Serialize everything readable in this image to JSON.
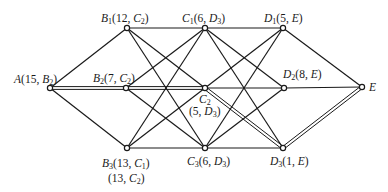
{
  "diagram": {
    "type": "multistage-shortest-path-graph",
    "colors": {
      "line": "#1a1a1a",
      "background": "#ffffff"
    },
    "nodes": [
      {
        "id": "A",
        "x": 50,
        "y": 88,
        "name": "A",
        "sub": "",
        "value": "15",
        "next": "B",
        "next_sub": "2",
        "label": "A(15, B2)"
      },
      {
        "id": "B1",
        "x": 127,
        "y": 28,
        "name": "B",
        "sub": "1",
        "value": "12",
        "next": "C",
        "next_sub": "2",
        "label": "B1(12, C2)"
      },
      {
        "id": "B2",
        "x": 126,
        "y": 88,
        "name": "B",
        "sub": "2",
        "value": "7",
        "next": "C",
        "next_sub": "2",
        "label": "B2(7, C2)"
      },
      {
        "id": "B3",
        "x": 127,
        "y": 148,
        "name": "B",
        "sub": "3",
        "value": "13",
        "next": "C",
        "next_sub": "1",
        "label": "B3(13, C1)",
        "alt_label": "(13, C2)"
      },
      {
        "id": "C1",
        "x": 205,
        "y": 28,
        "name": "C",
        "sub": "1",
        "value": "6",
        "next": "D",
        "next_sub": "3",
        "label": "C1(6, D3)"
      },
      {
        "id": "C2",
        "x": 205,
        "y": 88,
        "name": "C",
        "sub": "2",
        "value": "5",
        "next": "D",
        "next_sub": "3",
        "label": "C2 (5, D3)"
      },
      {
        "id": "C3",
        "x": 205,
        "y": 148,
        "name": "C",
        "sub": "3",
        "value": "6",
        "next": "D",
        "next_sub": "3",
        "label": "C3(6, D3)"
      },
      {
        "id": "D1",
        "x": 283,
        "y": 28,
        "name": "D",
        "sub": "1",
        "value": "5",
        "next": "E",
        "next_sub": "",
        "label": "D1(5, E)"
      },
      {
        "id": "D2",
        "x": 284,
        "y": 88,
        "name": "D",
        "sub": "2",
        "value": "8",
        "next": "E",
        "next_sub": "",
        "label": "D2(8, E)"
      },
      {
        "id": "D3",
        "x": 283,
        "y": 148,
        "name": "D",
        "sub": "3",
        "value": "1",
        "next": "E",
        "next_sub": "",
        "label": "D3(1, E)"
      },
      {
        "id": "E",
        "x": 362,
        "y": 87,
        "name": "E",
        "sub": "",
        "value": "",
        "next": "",
        "next_sub": "",
        "label": "E"
      }
    ],
    "edges": [
      [
        "A",
        "B1",
        false
      ],
      [
        "A",
        "B2",
        true
      ],
      [
        "A",
        "B3",
        false
      ],
      [
        "B1",
        "C1",
        false
      ],
      [
        "B1",
        "C2",
        false
      ],
      [
        "B1",
        "C3",
        false
      ],
      [
        "B2",
        "C1",
        false
      ],
      [
        "B2",
        "C2",
        true
      ],
      [
        "B2",
        "C3",
        false
      ],
      [
        "B3",
        "C1",
        false
      ],
      [
        "B3",
        "C2",
        false
      ],
      [
        "B3",
        "C3",
        false
      ],
      [
        "C1",
        "D1",
        false
      ],
      [
        "C1",
        "D2",
        false
      ],
      [
        "C1",
        "D3",
        false
      ],
      [
        "C2",
        "D1",
        false
      ],
      [
        "C2",
        "D2",
        false
      ],
      [
        "C2",
        "D3",
        true
      ],
      [
        "C3",
        "D1",
        false
      ],
      [
        "C3",
        "D2",
        false
      ],
      [
        "C3",
        "D3",
        false
      ],
      [
        "D1",
        "E",
        false
      ],
      [
        "D2",
        "E",
        false
      ],
      [
        "D3",
        "E",
        true
      ]
    ],
    "optimal_path": [
      "A",
      "B2",
      "C2",
      "D3",
      "E"
    ],
    "optimal_value": "15"
  }
}
